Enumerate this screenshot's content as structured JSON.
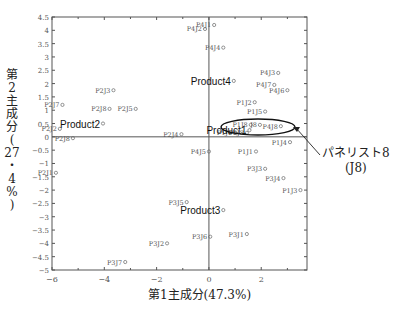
{
  "chart_data": {
    "type": "scatter",
    "title": "",
    "xlabel": "第1主成分(47.3%)",
    "ylabel": "第2主成分(27・4%)",
    "xlim": [
      -6,
      3.75
    ],
    "ylim": [
      -5,
      4.5
    ],
    "x_ticks": [
      -6,
      -4,
      -2,
      0,
      2
    ],
    "y_ticks": [
      4.5,
      4,
      3.5,
      3,
      2.5,
      2,
      1.5,
      1,
      0.5,
      0,
      -0.5,
      -1,
      -1.5,
      -2,
      -2.5,
      -3,
      -3.5,
      -4,
      -4.5,
      -5
    ],
    "grid": false,
    "products": [
      {
        "label": "Product1",
        "x": 1.55,
        "y": 0.25
      },
      {
        "label": "Product2",
        "x": -4.05,
        "y": 0.5
      },
      {
        "label": "Product3",
        "x": 0.55,
        "y": -2.75
      },
      {
        "label": "Product4",
        "x": 0.95,
        "y": 2.1
      }
    ],
    "points": [
      {
        "label": "P4J1",
        "x": 0.2,
        "y": 4.2
      },
      {
        "label": "P4J2",
        "x": -0.15,
        "y": 4.05
      },
      {
        "label": "P4J4",
        "x": 0.55,
        "y": 3.35
      },
      {
        "label": "P4J3",
        "x": 2.65,
        "y": 2.4
      },
      {
        "label": "P4J7",
        "x": 2.5,
        "y": 1.95
      },
      {
        "label": "P4J6",
        "x": 3.0,
        "y": 1.75
      },
      {
        "label": "P1J2",
        "x": 1.75,
        "y": 1.3
      },
      {
        "label": "P1J5",
        "x": 2.15,
        "y": 0.95
      },
      {
        "label": "P1J8",
        "x": 1.6,
        "y": 0.45
      },
      {
        "label": "P2J8b",
        "x": 1.45,
        "y": 0.15
      },
      {
        "label": "J8",
        "x": 1.95,
        "y": 0.45
      },
      {
        "label": "P4J8",
        "x": 2.75,
        "y": 0.4
      },
      {
        "label": "P1J6",
        "x": 1.0,
        "y": 0.15
      },
      {
        "label": "P1J4",
        "x": 3.1,
        "y": -0.2
      },
      {
        "label": "P1J1",
        "x": 1.8,
        "y": -0.55
      },
      {
        "label": "P3J3",
        "x": 2.15,
        "y": -1.2
      },
      {
        "label": "P3J4",
        "x": 2.85,
        "y": -1.55
      },
      {
        "label": "P1J3",
        "x": 3.5,
        "y": -2.0
      },
      {
        "label": "P4J5",
        "x": 0.0,
        "y": -0.55
      },
      {
        "label": "P2J4",
        "x": -1.05,
        "y": 0.1
      },
      {
        "label": "P3J5",
        "x": -0.85,
        "y": -2.45
      },
      {
        "label": "P3J1",
        "x": 1.45,
        "y": -3.65
      },
      {
        "label": "P3J6",
        "x": 0.05,
        "y": -3.75
      },
      {
        "label": "P3J2",
        "x": -1.6,
        "y": -4.0
      },
      {
        "label": "P3J7",
        "x": -3.2,
        "y": -4.7
      },
      {
        "label": "P2J3",
        "x": -3.65,
        "y": 1.75
      },
      {
        "label": "P2J8",
        "x": -3.8,
        "y": 1.05
      },
      {
        "label": "P2J5",
        "x": -2.8,
        "y": 1.05
      },
      {
        "label": "P2J7",
        "x": -5.6,
        "y": 1.2
      },
      {
        "label": "P2J2",
        "x": -5.7,
        "y": 0.3
      },
      {
        "label": "P2J8",
        "x": -5.2,
        "y": -0.05
      },
      {
        "label": "P2J1",
        "x": -5.85,
        "y": -1.35
      }
    ],
    "annotations": [
      {
        "text": "パネリスト8",
        "subtext": "(J8)",
        "target": "J8 cluster (ellipse)"
      }
    ]
  },
  "labels": {
    "ylabel_chars": [
      "第",
      "2",
      "主",
      "成",
      "分",
      "(",
      "27",
      "・",
      "4",
      "%",
      ")"
    ],
    "xlabel": "第1主成分(47.3%)",
    "callout_line1": "パネリスト8",
    "callout_line2": "(J8)"
  },
  "style": {
    "axis_color": "#555555",
    "point_color": "#666666",
    "text_color": "#555555",
    "product_color": "#111111"
  }
}
